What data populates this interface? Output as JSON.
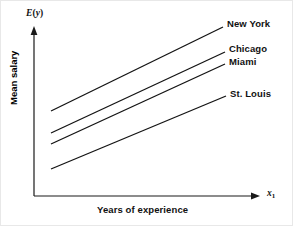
{
  "chart_data": {
    "type": "line",
    "title": "",
    "xlabel": "Years of experience",
    "ylabel": "Mean salary",
    "x_axis_symbol": "x",
    "x_axis_subscript": "1",
    "y_axis_symbol": "E(y)",
    "grid": false,
    "legend_position": "right-of-line-ends",
    "axis_style": "arrow-schematic",
    "tick_labels": {
      "x": [],
      "y": []
    },
    "xlim": [
      0,
      1
    ],
    "ylim": [
      0,
      1
    ],
    "note": "Schematic plot: four parallel lines, equal slope, different intercepts.",
    "series": [
      {
        "name": "New York",
        "label": "New York",
        "rank": 1,
        "intercept_level": "highest",
        "x": [
          0.1,
          0.9
        ],
        "y": [
          0.55,
          1.03
        ],
        "pixel_start": [
          50,
          110
        ],
        "pixel_end": [
          222,
          26
        ]
      },
      {
        "name": "Chicago",
        "label": "Chicago",
        "rank": 2,
        "intercept_level": "second",
        "x": [
          0.1,
          0.92
        ],
        "y": [
          0.42,
          0.89
        ],
        "pixel_start": [
          50,
          132
        ],
        "pixel_end": [
          224,
          51
        ]
      },
      {
        "name": "Miami",
        "label": "Miami",
        "rank": 3,
        "intercept_level": "third",
        "x": [
          0.1,
          0.92
        ],
        "y": [
          0.35,
          0.82
        ],
        "pixel_start": [
          50,
          143
        ],
        "pixel_end": [
          224,
          63
        ]
      },
      {
        "name": "St. Louis",
        "label": "St. Louis",
        "rank": 4,
        "intercept_level": "lowest",
        "x": [
          0.1,
          0.93
        ],
        "y": [
          0.19,
          0.64
        ],
        "pixel_start": [
          50,
          168
        ],
        "pixel_end": [
          225,
          95
        ]
      }
    ]
  },
  "axes": {
    "y_label_math": "E(y)",
    "y_label_e": "E",
    "y_label_open": "(",
    "y_label_y": "y",
    "y_label_close": ")",
    "x_label_math": "x",
    "x_label_sub": "1",
    "x_title": "Years of experience",
    "y_title": "Mean salary"
  },
  "colors": {
    "line": "#141414",
    "axis": "#1a1a1a",
    "text": "#111111",
    "background": "#ffffff"
  }
}
